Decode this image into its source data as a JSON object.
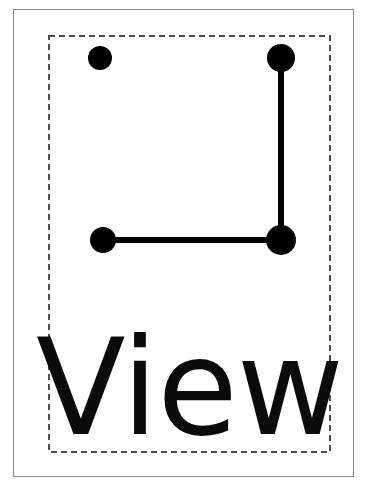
{
  "card": {
    "title": "View",
    "caption_label": "View",
    "background_color": "#ffffff",
    "ink_color": "#000000",
    "frame_border_color": "#8a8a8a",
    "dashed_border_color": "#4d4d4d"
  },
  "frame": {
    "name": "outer-frame",
    "x": 13,
    "y": 9,
    "width": 341,
    "height": 468,
    "border_width_px": 1,
    "style": "solid"
  },
  "selection_region": {
    "name": "dashed-selection-rectangle",
    "x": 48,
    "y": 35,
    "width": 283,
    "height": 418,
    "border_width_px": 2,
    "style": "dashed",
    "dash_length_px": 6,
    "dash_gap_px": 4
  },
  "gesture": {
    "name": "view-gesture-glyph",
    "description": "Four dots with an L-shaped stroke joining the top-right, bottom-right and bottom-left dots",
    "stroke_width_px": 6,
    "dots": [
      {
        "id": "dot-top-left",
        "label": "top-left",
        "cx": 100,
        "cy": 58,
        "r": 12,
        "connected": false
      },
      {
        "id": "dot-top-right",
        "label": "top-right",
        "cx": 281,
        "cy": 58,
        "r": 14,
        "connected": true
      },
      {
        "id": "dot-bottom-left",
        "label": "bottom-left",
        "cx": 103,
        "cy": 240,
        "r": 13,
        "connected": true
      },
      {
        "id": "dot-bottom-right",
        "label": "bottom-right",
        "cx": 281,
        "cy": 240,
        "r": 15,
        "connected": true
      }
    ],
    "path_points": [
      {
        "x": 281,
        "y": 58
      },
      {
        "x": 281,
        "y": 240
      },
      {
        "x": 103,
        "y": 240
      }
    ]
  }
}
